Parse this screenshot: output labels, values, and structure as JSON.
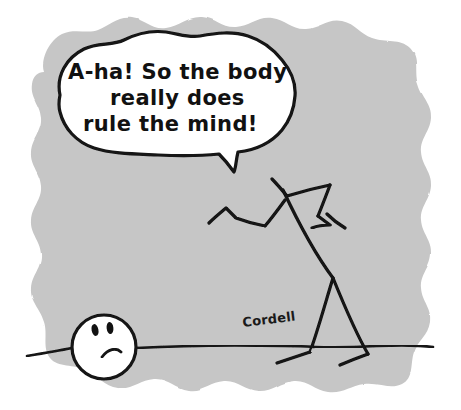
{
  "comic": {
    "title": "A-ha! So the body really does rule the mind!",
    "artist_signature": "Cordell",
    "panel": {
      "background_color": "#c6c6c6",
      "page_color": "#ffffff",
      "ink_color": "#121212",
      "edge_style": "hand-drawn wavy scalloped blob"
    },
    "speech_bubble": {
      "fill_color": "#ffffff",
      "outline_color": "#121212",
      "tail_direction": "down-right toward figure neck",
      "lines": [
        "A-ha! So the body",
        "really does",
        "rule the mind!"
      ],
      "line_alignment": [
        "left",
        "center",
        "center"
      ]
    },
    "characters": [
      {
        "name": "detached-head",
        "description": "round white head lying on the ground line",
        "expression": "frowning",
        "features": [
          "left-eye",
          "right-eye",
          "frown-mouth"
        ]
      },
      {
        "name": "headless-stick-body",
        "description": "headless stick figure leaning forward, two bent arms, two legs with feet",
        "features": [
          "neck-stump",
          "left-arm",
          "right-arm",
          "torso",
          "left-leg",
          "right-leg",
          "left-foot",
          "right-foot"
        ]
      }
    ],
    "ground": {
      "name": "ground-line",
      "description": "horizontal hand-drawn ground line"
    }
  }
}
